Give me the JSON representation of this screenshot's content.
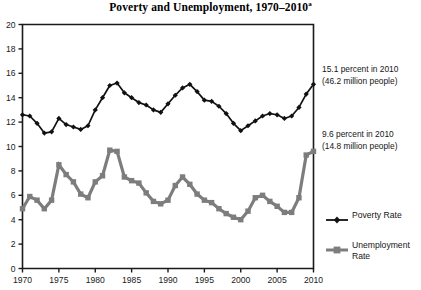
{
  "chart_data": {
    "type": "line",
    "title": "Poverty and Unemployment, 1970–2010",
    "title_superscript": "a",
    "xlabel": "",
    "ylabel": "",
    "xlim": [
      1970,
      2010
    ],
    "ylim": [
      0,
      20
    ],
    "ytick_step": 2,
    "xtick_step": 5,
    "grid": false,
    "legend_position": "right",
    "xticks": [
      1970,
      1975,
      1980,
      1985,
      1990,
      1995,
      2000,
      2005,
      2010
    ],
    "yticks": [
      0,
      2,
      4,
      6,
      8,
      10,
      12,
      14,
      16,
      18,
      20
    ],
    "x": [
      1970,
      1971,
      1972,
      1973,
      1974,
      1975,
      1976,
      1977,
      1978,
      1979,
      1980,
      1981,
      1982,
      1983,
      1984,
      1985,
      1986,
      1987,
      1988,
      1989,
      1990,
      1991,
      1992,
      1993,
      1994,
      1995,
      1996,
      1997,
      1998,
      1999,
      2000,
      2001,
      2002,
      2003,
      2004,
      2005,
      2006,
      2007,
      2008,
      2009,
      2010
    ],
    "series": [
      {
        "name": "Poverty Rate",
        "color": "#111111",
        "marker": "diamond",
        "values": [
          12.6,
          12.5,
          11.9,
          11.1,
          11.2,
          12.3,
          11.8,
          11.6,
          11.4,
          11.7,
          13.0,
          14.0,
          15.0,
          15.2,
          14.4,
          14.0,
          13.6,
          13.4,
          13.0,
          12.8,
          13.5,
          14.2,
          14.8,
          15.1,
          14.5,
          13.8,
          13.7,
          13.3,
          12.7,
          11.9,
          11.3,
          11.7,
          12.1,
          12.5,
          12.7,
          12.6,
          12.3,
          12.5,
          13.2,
          14.3,
          15.1
        ]
      },
      {
        "name": "Unemployment Rate",
        "color": "#7d7d7d",
        "marker": "square",
        "values": [
          4.9,
          5.9,
          5.6,
          4.9,
          5.6,
          8.5,
          7.7,
          7.1,
          6.1,
          5.8,
          7.1,
          7.6,
          9.7,
          9.6,
          7.5,
          7.2,
          7.0,
          6.2,
          5.5,
          5.3,
          5.6,
          6.8,
          7.5,
          6.9,
          6.1,
          5.6,
          5.4,
          4.9,
          4.5,
          4.2,
          4.0,
          4.7,
          5.8,
          6.0,
          5.5,
          5.1,
          4.6,
          4.6,
          5.8,
          9.3,
          9.6
        ]
      }
    ],
    "annotations": [
      {
        "id": "poverty",
        "line1": "15.1 percent in 2010",
        "line2": "(46.2 million people)"
      },
      {
        "id": "unemployment",
        "line1": "9.6 percent in 2010",
        "line2": "(14.8 million people)"
      }
    ],
    "legend": [
      {
        "label": "Poverty Rate",
        "color": "#111111",
        "marker": "diamond"
      },
      {
        "label": "Unemployment Rate",
        "color": "#7d7d7d",
        "marker": "square"
      }
    ]
  }
}
